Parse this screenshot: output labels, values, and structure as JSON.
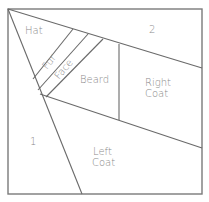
{
  "diagram": {
    "type": "pattern-piece-layout",
    "regions": [
      {
        "id": "hat",
        "label": "Hat"
      },
      {
        "id": "fur",
        "label": "Fur"
      },
      {
        "id": "face",
        "label": "Face"
      },
      {
        "id": "beard",
        "label": "Beard"
      },
      {
        "id": "right-coat",
        "label": "Right",
        "label2": "Coat"
      },
      {
        "id": "left-coat",
        "label": "Left",
        "label2": "Coat"
      },
      {
        "id": "region-1",
        "label": "1"
      },
      {
        "id": "region-2",
        "label": "2"
      }
    ],
    "colors": {
      "line": "#6a6a6a",
      "frame": "#7a7a7a",
      "text": "#8a8a8a",
      "background": "#ffffff"
    }
  }
}
